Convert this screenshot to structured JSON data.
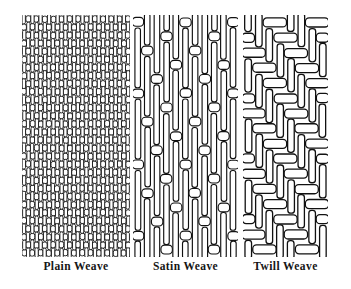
{
  "figure": {
    "kind": "textile-weave-comparison-diagram",
    "background_color": "#ffffff",
    "ink_color": "#111111",
    "yarn_fill_color": "#ffffff"
  },
  "panels": [
    {
      "id": "plain",
      "label": "Plain Weave",
      "pattern": "1/1 checkerboard",
      "description": "Over-one-under-one interlacing; tightest, densest structure",
      "warp_count": 26,
      "weft_count": 30,
      "float_length": 1,
      "shift": 1
    },
    {
      "id": "satin",
      "label": "Satin Weave",
      "pattern": "long warp floats",
      "description": "Warp yarns float over several wefts; few interlacings, smooth face",
      "warp_count": 11,
      "weft_count": 17,
      "float_length": 4,
      "shift": 2
    },
    {
      "id": "twill",
      "label": "Twill Weave",
      "pattern": "2/2 diagonal",
      "description": "Interlacings step over one yarn each row creating a diagonal rib",
      "warp_count": 8,
      "weft_count": 16,
      "float_length": 2,
      "shift": 1
    }
  ],
  "labels": {
    "plain": "Plain Weave",
    "satin": "Satin Weave",
    "twill": "Twill Weave"
  }
}
